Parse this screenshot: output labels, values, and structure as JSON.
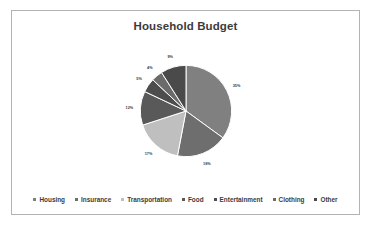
{
  "chart_data": {
    "type": "pie",
    "title": "Household Budget",
    "xlabel": "",
    "ylabel": "",
    "legend_position": "bottom",
    "grid": false,
    "categories": [
      "Housing",
      "Insurance",
      "Transportation",
      "Food",
      "Entertainment",
      "Clothing",
      "Other"
    ],
    "values": [
      35,
      18,
      17,
      12,
      5,
      4,
      9
    ],
    "value_labels": [
      "35%",
      "18%",
      "17%",
      "12%",
      "5%",
      "4%",
      "9%"
    ],
    "colors": [
      "#808080",
      "#6e6e6e",
      "#bfbfbf",
      "#595959",
      "#4d4d4d",
      "#6b6b6b",
      "#4a4a4a"
    ],
    "slice_border_color": "#ffffff",
    "start_angle_deg": 0,
    "direction": "clockwise",
    "slices": [
      {
        "label": "Housing",
        "value": 35,
        "value_label": "35%",
        "color": "#808080"
      },
      {
        "label": "Insurance",
        "value": 18,
        "value_label": "18%",
        "color": "#6e6e6e"
      },
      {
        "label": "Transportation",
        "value": 17,
        "value_label": "17%",
        "color": "#bfbfbf"
      },
      {
        "label": "Food",
        "value": 12,
        "value_label": "12%",
        "color": "#595959"
      },
      {
        "label": "Entertainment",
        "value": 5,
        "value_label": "5%",
        "color": "#4d4d4d"
      },
      {
        "label": "Clothing",
        "value": 4,
        "value_label": "4%",
        "color": "#6b6b6b"
      },
      {
        "label": "Other",
        "value": 9,
        "value_label": "9%",
        "color": "#4a4a4a"
      }
    ]
  },
  "frame": {
    "border_color": "#b3b3b3",
    "background": "#ffffff"
  },
  "text": {
    "title_color": "#3b3b3b",
    "label_color": "#3b3b3b"
  }
}
